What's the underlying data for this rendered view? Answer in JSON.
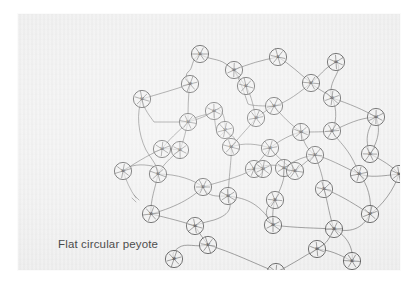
{
  "document": {
    "caption": "Flat circular peyote",
    "page_background": "#ffffff",
    "sheet_background": "#eeeeee",
    "ink_color": "#4a4a4a",
    "caption_color": "#3a3a3a"
  },
  "diagram": {
    "type": "beadwork-stitch-diagram",
    "stitch_name": "Flat circular peyote",
    "bead_count": 45,
    "bead_radius": 8.6,
    "has_thread_tail": true,
    "has_needle": true,
    "beads": [
      {
        "n": "10",
        "x": 182,
        "y": 40
      },
      {
        "n": "09",
        "x": 216,
        "y": 56
      },
      {
        "n": "11",
        "x": 260,
        "y": 43
      },
      {
        "n": "08",
        "x": 172,
        "y": 70
      },
      {
        "n": "06",
        "x": 318,
        "y": 48
      },
      {
        "n": "07",
        "x": 293,
        "y": 69
      },
      {
        "n": "05",
        "x": 314,
        "y": 84
      },
      {
        "n": "12",
        "x": 124,
        "y": 85
      },
      {
        "n": "16",
        "x": 256,
        "y": 92
      },
      {
        "n": "04",
        "x": 358,
        "y": 103
      },
      {
        "n": "13",
        "x": 170,
        "y": 108
      },
      {
        "n": "17",
        "x": 207,
        "y": 116
      },
      {
        "n": "03",
        "x": 283,
        "y": 118
      },
      {
        "n": "02",
        "x": 314,
        "y": 117
      },
      {
        "n": "14",
        "x": 144,
        "y": 135
      },
      {
        "n": "18",
        "x": 213,
        "y": 133
      },
      {
        "n": "01",
        "x": 252,
        "y": 134
      },
      {
        "n": "15",
        "x": 162,
        "y": 136
      },
      {
        "n": "20",
        "x": 352,
        "y": 140
      },
      {
        "n": "30",
        "x": 105,
        "y": 157
      },
      {
        "n": "31",
        "x": 140,
        "y": 160
      },
      {
        "n": "19",
        "x": 236,
        "y": 155
      },
      {
        "n": "21",
        "x": 266,
        "y": 154
      },
      {
        "n": "22",
        "x": 297,
        "y": 141
      },
      {
        "n": "24",
        "x": 341,
        "y": 160
      },
      {
        "n": "34",
        "x": 381,
        "y": 160
      },
      {
        "n": "32",
        "x": 185,
        "y": 173
      },
      {
        "n": "23",
        "x": 245,
        "y": 155
      },
      {
        "n": "25",
        "x": 306,
        "y": 175
      },
      {
        "n": "35",
        "x": 133,
        "y": 200
      },
      {
        "n": "33",
        "x": 210,
        "y": 182
      },
      {
        "n": "26",
        "x": 257,
        "y": 186
      },
      {
        "n": "27",
        "x": 352,
        "y": 200
      },
      {
        "n": "36",
        "x": 177,
        "y": 212
      },
      {
        "n": "28",
        "x": 316,
        "y": 215
      },
      {
        "n": "29",
        "x": 255,
        "y": 211
      },
      {
        "n": "37",
        "x": 190,
        "y": 231
      },
      {
        "n": "38",
        "x": 156,
        "y": 245
      },
      {
        "n": "39",
        "x": 299,
        "y": 235
      },
      {
        "n": "40",
        "x": 334,
        "y": 247
      },
      {
        "n": "41",
        "x": 258,
        "y": 258
      },
      {
        "n": "42",
        "x": 228,
        "y": 72
      },
      {
        "n": "43",
        "x": 238,
        "y": 104
      },
      {
        "n": "44",
        "x": 196,
        "y": 97
      },
      {
        "n": "45",
        "x": 277,
        "y": 157
      }
    ]
  }
}
